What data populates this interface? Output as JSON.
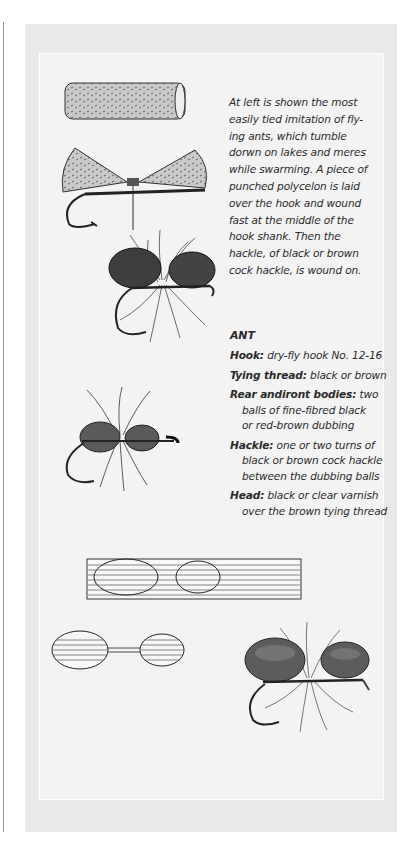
{
  "page": {
    "intro_lines": [
      "At left is shown the most",
      "easily tied imitation of fly-",
      "ing ants, which tumble",
      "dorwn on lakes and meres",
      "while swarming. A piece of",
      "punched polycelon is laid",
      "over the hook and wound",
      "fast at the middle of the",
      "hook shank. Then the",
      "hackle, of black or brown",
      "cock hackle, is wound on."
    ],
    "recipe": {
      "title": "ANT",
      "hook_label": "Hook:",
      "hook_value": "dry-fly hook No. 12-16",
      "thread_label": "Tying thread:",
      "thread_value": "black or brown",
      "bodies_label": "Rear andiront bodies:",
      "bodies_value_1": "two",
      "bodies_value_2": "balls of fine-fibred black",
      "bodies_value_3": "or red-brown dubbing",
      "hackle_label": "Hackle:",
      "hackle_value_1": "one or two turns of",
      "hackle_value_2": "black or brown cock hackle",
      "hackle_value_3": "between the dubbing balls",
      "head_label": "Head:",
      "head_value_1": "black or clear varnish",
      "head_value_2": "over the brown tying thread"
    },
    "illustrations": [
      "polycelon-cylinder",
      "polycelon-wound-on-hook",
      "finished-polycelon-ant",
      "dubbed-ant",
      "foam-sheet-with-ovals",
      "cut-oval-bodies",
      "finished-foam-ant"
    ],
    "colors": {
      "outer_panel": "#e9e9e9",
      "inner_panel": "#f3f3f3",
      "text": "#2a2a2a"
    }
  }
}
